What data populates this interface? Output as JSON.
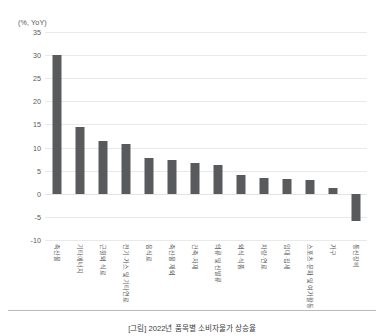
{
  "chart_data": {
    "type": "bar",
    "title": "",
    "subtitle": "",
    "xlabel": "",
    "ylabel": "(%, YoY)",
    "unit_label": "(%, YoY)",
    "ylim": [
      -10,
      35
    ],
    "yticks": [
      35,
      30,
      25,
      20,
      15,
      10,
      5,
      0,
      -5,
      -10
    ],
    "ytick_labels": [
      "35",
      "30",
      "25",
      "20",
      "15",
      "10",
      "5",
      "0",
      "-5",
      "-10"
    ],
    "grid": true,
    "grid_axis": "y",
    "legend": false,
    "legend_position": "none",
    "bar_color": "#595a5c",
    "grid_color": "#e9e9ea",
    "categories": [
      "축산물",
      "기타에너지",
      "근원외 식료",
      "전기·가스 및 기타연료",
      "음식료",
      "축산물 제외",
      "건축·자재",
      "의류 및 신발류",
      "외식·식품",
      "차량·연료",
      "임대·집세",
      "스포츠·문화 및 여가활동",
      "가구",
      "통신장비"
    ],
    "values": [
      30.0,
      14.5,
      11.5,
      10.7,
      7.7,
      7.4,
      6.7,
      6.3,
      4.1,
      3.4,
      3.3,
      3.0,
      1.2,
      -6.0
    ]
  },
  "caption": {
    "text": "[그림] 2022년 품목별 소비자물가 상승율"
  }
}
